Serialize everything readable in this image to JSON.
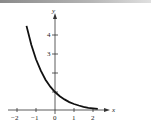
{
  "chart_data": {
    "type": "line",
    "title": "",
    "xlabel": "x",
    "ylabel": "y",
    "xlim": [
      -2.5,
      2.8
    ],
    "ylim": [
      -0.5,
      5.2
    ],
    "x_ticks": [
      "-2",
      "-1",
      "0",
      "1",
      "2"
    ],
    "y_ticks": [
      "1",
      "2",
      "3",
      "4"
    ],
    "y_tick_labels_shown": [
      "3",
      "4"
    ],
    "grid": false,
    "legend": null,
    "series": [
      {
        "name": "y = e^(-x)",
        "x": [
          -1.5,
          -1.25,
          -1.0,
          -0.75,
          -0.5,
          -0.25,
          0,
          0.25,
          0.5,
          0.75,
          1.0,
          1.25,
          1.5,
          1.75,
          2.0,
          2.25
        ],
        "y": [
          4.48,
          3.49,
          2.72,
          2.12,
          1.65,
          1.28,
          1.0,
          0.78,
          0.61,
          0.47,
          0.37,
          0.29,
          0.22,
          0.17,
          0.14,
          0.11
        ]
      }
    ]
  },
  "labels": {
    "x_axis": "x",
    "y_axis": "y",
    "xt_m2": "−2",
    "xt_m1": "−1",
    "xt_0": "0",
    "xt_1": "1",
    "xt_2": "2",
    "yt_3": "3",
    "yt_4": "4"
  }
}
